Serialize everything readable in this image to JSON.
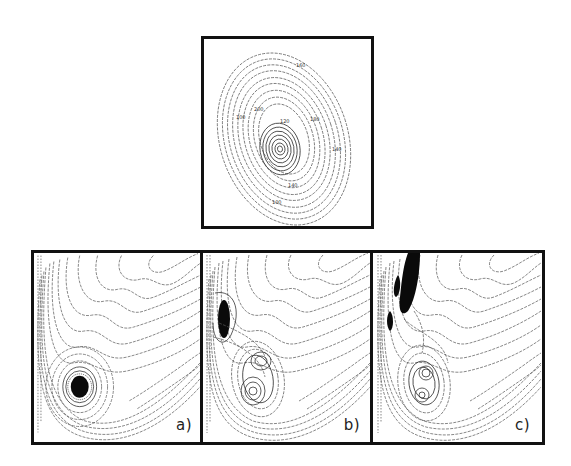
{
  "figure": {
    "top_panel": {
      "description": "Elliptical contour map with concentric tilted ellipses and an inner local well",
      "contour_labels": [
        "160",
        "200",
        "180",
        "120",
        "100",
        "140",
        "140",
        "100"
      ]
    },
    "bottom_panels": [
      {
        "id": "a",
        "label": "a)",
        "description": "L-shaped valley contour map with single dark localized density near the bottom well"
      },
      {
        "id": "b",
        "label": "b)",
        "description": "Same valley contour map with dark density shifted to upper-left wall and double-well contours below"
      },
      {
        "id": "c",
        "label": "c)",
        "description": "Same valley contour map with elongated dark density streaks along the left wall and nested contours in the well"
      }
    ]
  },
  "colors": {
    "border": "#111111",
    "contour": "#555555",
    "density": "#0a0a0a",
    "background": "#ffffff"
  }
}
